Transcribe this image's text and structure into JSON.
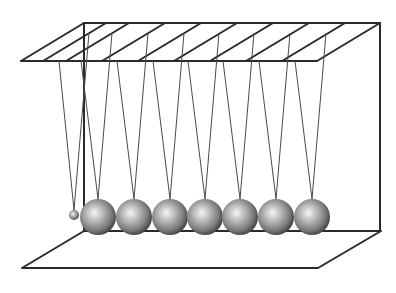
{
  "diagram": {
    "colors": {
      "background": "#ffffff",
      "frame": "#2a2a2a",
      "string": "#4a4a4a",
      "ball_highlight": "#f2f2f2",
      "ball_mid": "#a8a8a8",
      "ball_shadow": "#3c3c3c"
    },
    "top_frame": {
      "back_left": [
        84,
        23
      ],
      "back_right": [
        380,
        23
      ],
      "front_left": [
        21,
        61
      ],
      "front_right": [
        317,
        61
      ],
      "crossbars_front_x": [
        21,
        43,
        66,
        102,
        138,
        174,
        210,
        246,
        282,
        317
      ],
      "crossbar_offset": [
        63,
        -38
      ]
    },
    "base": {
      "back_left": [
        84,
        231
      ],
      "back_right": [
        381,
        231
      ],
      "front_left": [
        22,
        268
      ],
      "front_right": [
        318,
        268
      ]
    },
    "posts": [
      {
        "x": 84,
        "y1": 23,
        "y2": 231
      },
      {
        "x": 380,
        "y1": 23,
        "y2": 231
      }
    ],
    "small_ball": {
      "cx": 74,
      "cy": 215,
      "r": 5,
      "string_tops": [
        [
          59,
          61
        ],
        [
          89,
          33
        ]
      ]
    },
    "balls": [
      {
        "cx": 98,
        "cy": 217,
        "r": 18
      },
      {
        "cx": 134,
        "cy": 217,
        "r": 18
      },
      {
        "cx": 170,
        "cy": 217,
        "r": 18
      },
      {
        "cx": 205,
        "cy": 217,
        "r": 18
      },
      {
        "cx": 240,
        "cy": 217,
        "r": 18
      },
      {
        "cx": 276,
        "cy": 217,
        "r": 18
      },
      {
        "cx": 312,
        "cy": 217,
        "r": 18
      }
    ],
    "string_front_dx": -17,
    "string_back_dx": 14,
    "string_back_y": 33
  }
}
